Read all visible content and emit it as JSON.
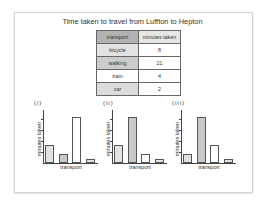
{
  "title": "Time taken to travel from Luffton to Hepton",
  "table": {
    "headers": [
      "transport",
      "minutes taken"
    ],
    "rows": [
      {
        "transport": "bicycle",
        "minutes": "8",
        "color": "#e2e2e2"
      },
      {
        "transport": "walking",
        "minutes": "21",
        "color": "#cccccc"
      },
      {
        "transport": "train",
        "minutes": "4",
        "color": "#ffffff"
      },
      {
        "transport": "car",
        "minutes": "2",
        "color": "#dcdcdc"
      }
    ]
  },
  "chart_data": [
    {
      "type": "bar",
      "label": "(i)",
      "categories": [
        "bicycle",
        "walking",
        "train",
        "car"
      ],
      "values": [
        8,
        4,
        21,
        2
      ],
      "colors": [
        "#e2e2e2",
        "#c8c8c8",
        "#ffffff",
        "#e2e2e2"
      ],
      "xlabel": "transport",
      "ylabel": "minutes taken",
      "ylim": [
        0,
        24
      ]
    },
    {
      "type": "bar",
      "label": "(ii)",
      "categories": [
        "bicycle",
        "walking",
        "train",
        "car"
      ],
      "values": [
        8,
        21,
        4,
        2
      ],
      "colors": [
        "#e2e2e2",
        "#c8c8c8",
        "#ffffff",
        "#e2e2e2"
      ],
      "xlabel": "transport",
      "ylabel": "minutes taken",
      "ylim": [
        0,
        24
      ]
    },
    {
      "type": "bar",
      "label": "(iii)",
      "categories": [
        "bicycle",
        "walking",
        "train",
        "car"
      ],
      "values": [
        4,
        21,
        8,
        2
      ],
      "colors": [
        "#e2e2e2",
        "#c8c8c8",
        "#ffffff",
        "#e2e2e2"
      ],
      "xlabel": "transport",
      "ylabel": "minutes taken",
      "ylim": [
        0,
        24
      ]
    }
  ]
}
